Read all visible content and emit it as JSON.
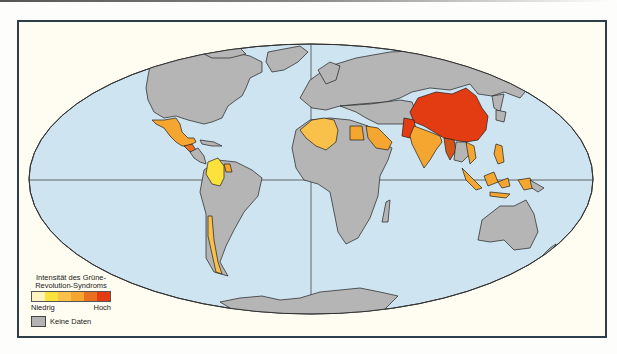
{
  "map": {
    "projection": "Mollweide",
    "colors": {
      "ocean": "#cfe4f1",
      "no_data": "#b5b5b5",
      "border": "#1f1f1f",
      "frame_bg": "#fffdf1",
      "levels": [
        "#fdf3c0",
        "#fce23a",
        "#f9c14a",
        "#f5a630",
        "#ea7020",
        "#e43c12"
      ]
    },
    "countries_highlighted": [
      {
        "name": "China",
        "level": 6
      },
      {
        "name": "Pakistan",
        "level": 6
      },
      {
        "name": "Myanmar",
        "level": 5
      },
      {
        "name": "India",
        "level": 4
      },
      {
        "name": "Vietnam",
        "level": 4
      },
      {
        "name": "Indonesia",
        "level": 4
      },
      {
        "name": "Philippines",
        "level": 4
      },
      {
        "name": "Mexico",
        "level": 4
      },
      {
        "name": "Guatemala",
        "level": 5
      },
      {
        "name": "Colombia",
        "level": 2
      },
      {
        "name": "Guyana",
        "level": 4
      },
      {
        "name": "Chile",
        "level": 3
      },
      {
        "name": "Algeria",
        "level": 4
      },
      {
        "name": "Morocco",
        "level": 4
      },
      {
        "name": "Egypt",
        "level": 4
      },
      {
        "name": "Saudi Arabia",
        "level": 4
      },
      {
        "name": "Papua New Guinea",
        "level": 4
      }
    ]
  },
  "legend": {
    "title": "Intensität des Grüne-Revolution-Syndroms",
    "low_label": "Niedrig",
    "high_label": "Hoch",
    "no_data_label": "Keine Daten"
  }
}
